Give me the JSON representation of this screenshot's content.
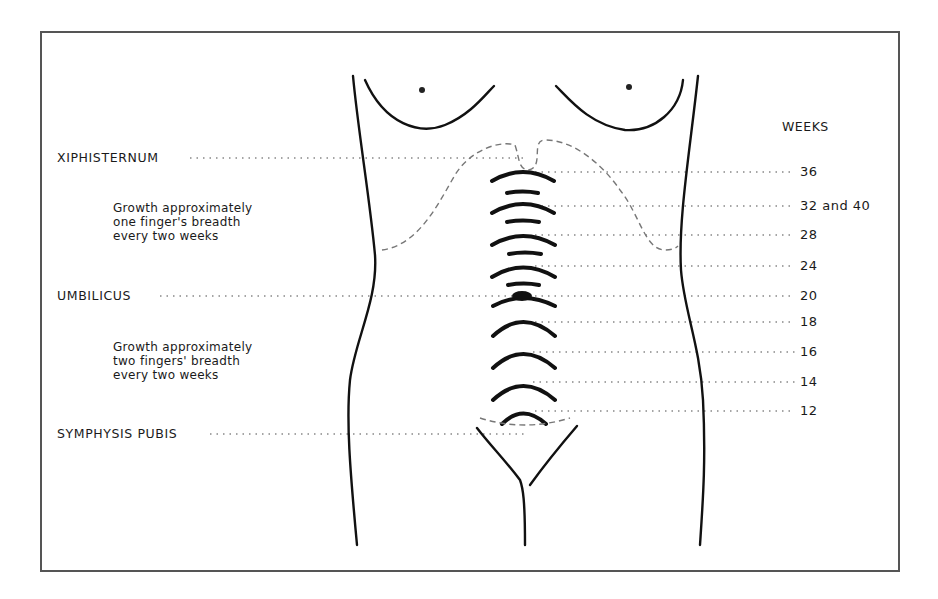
{
  "diagram": {
    "type": "fundal-height-chart",
    "landmarks": [
      {
        "label": "XIPHISTERNUM",
        "y": 158
      },
      {
        "label": "UMBILICUS",
        "y": 296
      },
      {
        "label": "SYMPHYSIS PUBIS",
        "y": 434
      }
    ],
    "notes": [
      {
        "lines": [
          "Growth approximately",
          "one finger's breadth",
          "every two weeks"
        ]
      },
      {
        "lines": [
          "Growth approximately",
          "two fingers' breadth",
          "every two weeks"
        ]
      }
    ],
    "weeks_header": "WEEKS",
    "weeks": [
      {
        "label": "36",
        "y": 172
      },
      {
        "label": "32 and 40",
        "y": 206
      },
      {
        "label": "28",
        "y": 235
      },
      {
        "label": "24",
        "y": 266
      },
      {
        "label": "20",
        "y": 296
      },
      {
        "label": "18",
        "y": 322
      },
      {
        "label": "16",
        "y": 352
      },
      {
        "label": "14",
        "y": 382
      },
      {
        "label": "12",
        "y": 411
      }
    ],
    "colors": {
      "line": "#111111",
      "dotted": "#888888",
      "frame": "#555555",
      "background": "#ffffff"
    }
  }
}
